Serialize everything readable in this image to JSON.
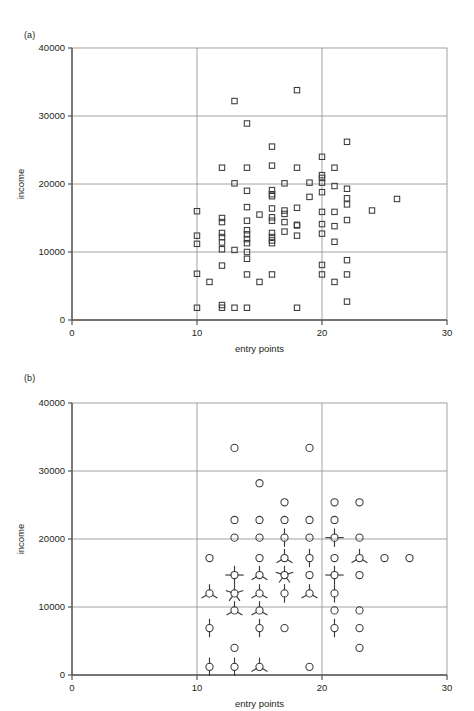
{
  "figure": {
    "background": "#ffffff",
    "ink": "#231f20",
    "grid_color": "#8c8c8c",
    "axis_color": "#6e6e6e",
    "marker_color": "#3a3a3a"
  },
  "panels": [
    {
      "id": "a",
      "label": "(a)",
      "xlabel": "entry points",
      "ylabel": "income",
      "xticks": [
        0,
        10,
        20,
        30
      ],
      "xtick_labels": [
        "0",
        "10",
        "20",
        "30"
      ],
      "yticks": [
        0,
        10000,
        20000,
        30000,
        40000
      ],
      "ytick_labels": [
        "0",
        "10000",
        "20000",
        "30000",
        "40000"
      ],
      "xlim": [
        0,
        30
      ],
      "ylim": [
        0,
        40000
      ],
      "marker": "square",
      "grid": "major-x-at-10-20, major-y-at-10000-20000-30000"
    },
    {
      "id": "b",
      "label": "(b)",
      "xlabel": "entry points",
      "ylabel": "income",
      "xticks": [
        0,
        10,
        20,
        30
      ],
      "xtick_labels": [
        "0",
        "10",
        "20",
        "30"
      ],
      "yticks": [
        0,
        10000,
        20000,
        30000,
        40000
      ],
      "ytick_labels": [
        "0",
        "10000",
        "20000",
        "30000",
        "40000"
      ],
      "xlim": [
        0,
        30
      ],
      "ylim": [
        0,
        40000
      ],
      "marker": "sunflower",
      "grid": "major-x-at-10-20, major-y-at-10000-20000-30000"
    }
  ],
  "chart_data": [
    {
      "type": "scatter",
      "panel": "a",
      "title": "(a)",
      "xlabel": "entry points",
      "ylabel": "income",
      "xlim": [
        0,
        30
      ],
      "ylim": [
        0,
        40000
      ],
      "xticks": [
        0,
        10,
        20,
        30
      ],
      "yticks": [
        0,
        10000,
        20000,
        30000,
        40000
      ],
      "grid": true,
      "marker": "open-square",
      "points": [
        [
          10,
          16000
        ],
        [
          10,
          12400
        ],
        [
          10,
          11200
        ],
        [
          10,
          6800
        ],
        [
          10,
          1800
        ],
        [
          11,
          5600
        ],
        [
          12,
          22400
        ],
        [
          12,
          15000
        ],
        [
          12,
          14400
        ],
        [
          12,
          12800
        ],
        [
          12,
          12200
        ],
        [
          12,
          11400
        ],
        [
          12,
          10400
        ],
        [
          12,
          8000
        ],
        [
          12,
          2200
        ],
        [
          12,
          1800
        ],
        [
          13,
          32200
        ],
        [
          13,
          20100
        ],
        [
          13,
          10300
        ],
        [
          13,
          1800
        ],
        [
          14,
          28900
        ],
        [
          14,
          22400
        ],
        [
          14,
          19000
        ],
        [
          14,
          16600
        ],
        [
          14,
          14600
        ],
        [
          14,
          13200
        ],
        [
          14,
          12600
        ],
        [
          14,
          11900
        ],
        [
          14,
          11300
        ],
        [
          14,
          10000
        ],
        [
          14,
          9000
        ],
        [
          14,
          6700
        ],
        [
          14,
          1800
        ],
        [
          15,
          15500
        ],
        [
          15,
          5600
        ],
        [
          16,
          25500
        ],
        [
          16,
          22700
        ],
        [
          16,
          19100
        ],
        [
          16,
          18500
        ],
        [
          16,
          18200
        ],
        [
          16,
          16400
        ],
        [
          16,
          15100
        ],
        [
          16,
          14600
        ],
        [
          16,
          12800
        ],
        [
          16,
          12200
        ],
        [
          16,
          11700
        ],
        [
          16,
          11300
        ],
        [
          16,
          6700
        ],
        [
          17,
          20100
        ],
        [
          17,
          16100
        ],
        [
          17,
          15600
        ],
        [
          17,
          14400
        ],
        [
          17,
          13000
        ],
        [
          18,
          33800
        ],
        [
          18,
          22400
        ],
        [
          18,
          16500
        ],
        [
          18,
          14000
        ],
        [
          18,
          13900
        ],
        [
          18,
          12400
        ],
        [
          18,
          1800
        ],
        [
          19,
          20200
        ],
        [
          19,
          18100
        ],
        [
          20,
          24000
        ],
        [
          20,
          21300
        ],
        [
          20,
          20900
        ],
        [
          20,
          20200
        ],
        [
          20,
          18800
        ],
        [
          20,
          15900
        ],
        [
          20,
          14100
        ],
        [
          20,
          12700
        ],
        [
          20,
          8100
        ],
        [
          20,
          6700
        ],
        [
          21,
          22400
        ],
        [
          21,
          19700
        ],
        [
          21,
          15900
        ],
        [
          21,
          13800
        ],
        [
          21,
          11500
        ],
        [
          21,
          5600
        ],
        [
          22,
          26200
        ],
        [
          22,
          19300
        ],
        [
          22,
          17900
        ],
        [
          22,
          17000
        ],
        [
          22,
          14700
        ],
        [
          22,
          8800
        ],
        [
          22,
          6700
        ],
        [
          22,
          2700
        ],
        [
          24,
          16100
        ],
        [
          26,
          17800
        ]
      ]
    },
    {
      "type": "scatter",
      "panel": "b",
      "title": "(b)",
      "xlabel": "entry points",
      "ylabel": "income",
      "xlim": [
        0,
        30
      ],
      "ylim": [
        0,
        40000
      ],
      "xticks": [
        0,
        10,
        20,
        30
      ],
      "yticks": [
        0,
        10000,
        20000,
        30000,
        40000
      ],
      "grid": true,
      "marker": "sunflower",
      "note": "binned sunflower plot; petal count encodes number of overlapping observations, 1 petal = 1 case plus base circle",
      "points": [
        [
          11,
          17200,
          1
        ],
        [
          11,
          12000,
          3
        ],
        [
          11,
          6900,
          2
        ],
        [
          11,
          1200,
          2
        ],
        [
          13,
          33400,
          1
        ],
        [
          13,
          22800,
          1
        ],
        [
          13,
          20200,
          1
        ],
        [
          13,
          14700,
          4
        ],
        [
          13,
          12000,
          5
        ],
        [
          13,
          9500,
          3
        ],
        [
          13,
          4000,
          1
        ],
        [
          13,
          1200,
          2
        ],
        [
          15,
          28200,
          1
        ],
        [
          15,
          22800,
          1
        ],
        [
          15,
          20200,
          1
        ],
        [
          15,
          17200,
          1
        ],
        [
          15,
          14700,
          3
        ],
        [
          15,
          12000,
          3
        ],
        [
          15,
          9500,
          3
        ],
        [
          15,
          6900,
          2
        ],
        [
          15,
          1200,
          3
        ],
        [
          17,
          25400,
          1
        ],
        [
          17,
          22800,
          1
        ],
        [
          17,
          20200,
          2
        ],
        [
          17,
          17200,
          3
        ],
        [
          17,
          14700,
          5
        ],
        [
          17,
          12000,
          2
        ],
        [
          17,
          6900,
          1
        ],
        [
          19,
          33400,
          1
        ],
        [
          19,
          22800,
          1
        ],
        [
          19,
          20200,
          1
        ],
        [
          19,
          17200,
          2
        ],
        [
          19,
          14700,
          1
        ],
        [
          19,
          12000,
          3
        ],
        [
          19,
          1200,
          1
        ],
        [
          21,
          25400,
          1
        ],
        [
          21,
          22800,
          1
        ],
        [
          21,
          20200,
          4
        ],
        [
          21,
          17200,
          1
        ],
        [
          21,
          14700,
          4
        ],
        [
          21,
          12000,
          2
        ],
        [
          21,
          9500,
          1
        ],
        [
          21,
          6900,
          2
        ],
        [
          23,
          25400,
          1
        ],
        [
          23,
          20200,
          1
        ],
        [
          23,
          17200,
          3
        ],
        [
          23,
          14700,
          1
        ],
        [
          23,
          9500,
          1
        ],
        [
          23,
          6900,
          1
        ],
        [
          23,
          4000,
          1
        ],
        [
          25,
          17200,
          1
        ],
        [
          27,
          17200,
          1
        ]
      ]
    }
  ]
}
